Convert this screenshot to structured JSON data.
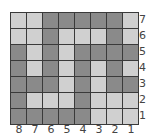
{
  "board": {
    "columns": 8,
    "rows": 7,
    "colors": {
      "light": "#d0d0d0",
      "dark": "#8a8a8a",
      "grid_line": "#3a3a3a",
      "label": "#444444"
    },
    "grid": [
      [
        "L",
        "L",
        "D",
        "D",
        "D",
        "D",
        "D",
        "L"
      ],
      [
        "L",
        "L",
        "D",
        "L",
        "L",
        "L",
        "D",
        "L"
      ],
      [
        "D",
        "L",
        "D",
        "L",
        "D",
        "D",
        "D",
        "D"
      ],
      [
        "D",
        "L",
        "D",
        "L",
        "D",
        "L",
        "D",
        "L"
      ],
      [
        "D",
        "D",
        "D",
        "L",
        "D",
        "L",
        "D",
        "D"
      ],
      [
        "D",
        "L",
        "L",
        "L",
        "D",
        "L",
        "L",
        "L"
      ],
      [
        "D",
        "D",
        "D",
        "D",
        "D",
        "L",
        "L",
        "L"
      ]
    ]
  },
  "row_labels": [
    "7",
    "6",
    "5",
    "4",
    "3",
    "2",
    "1"
  ],
  "col_labels": [
    "8",
    "7",
    "6",
    "5",
    "4",
    "3",
    "2",
    "1"
  ]
}
